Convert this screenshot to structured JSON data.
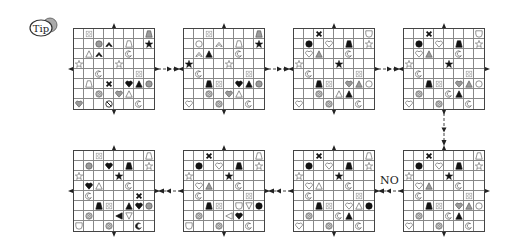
{
  "tip": {
    "label": "Tip"
  },
  "no_label": "NO",
  "colors": {
    "black": "#111111",
    "gray": "#9a9a9a",
    "outline": "#555555",
    "grid": "#888888"
  },
  "grids": [
    {
      "name": "grid-1",
      "x": 73,
      "y": 28,
      "cells": [
        [
          0,
          1,
          "ornate"
        ],
        [
          0,
          7,
          "trap-gray"
        ],
        [
          1,
          2,
          "circle-gray"
        ],
        [
          1,
          3,
          "chevron-black"
        ],
        [
          1,
          5,
          "trap-white"
        ],
        [
          1,
          7,
          "star-black"
        ],
        [
          2,
          1,
          "tri-white"
        ],
        [
          2,
          2,
          "chevron-black"
        ],
        [
          2,
          5,
          "crescent"
        ],
        [
          3,
          0,
          "star-white"
        ],
        [
          3,
          4,
          "star-white"
        ],
        [
          4,
          2,
          "crescent"
        ],
        [
          4,
          6,
          "ornate"
        ],
        [
          5,
          1,
          "trap-white"
        ],
        [
          5,
          3,
          "x-black"
        ],
        [
          5,
          5,
          "heart-black"
        ],
        [
          5,
          6,
          "tri-black"
        ],
        [
          5,
          7,
          "circle-gray"
        ],
        [
          6,
          2,
          "hatch"
        ],
        [
          6,
          4,
          "heart-gray"
        ],
        [
          6,
          5,
          "tri-white"
        ],
        [
          7,
          0,
          "heart-gray"
        ],
        [
          7,
          3,
          "nosign"
        ],
        [
          7,
          6,
          "crescent"
        ]
      ]
    },
    {
      "name": "grid-2",
      "x": 183,
      "y": 28,
      "cells": [
        [
          0,
          2,
          "ornate"
        ],
        [
          0,
          7,
          "trap-gray"
        ],
        [
          1,
          1,
          "circle-white"
        ],
        [
          1,
          3,
          "chevron-white"
        ],
        [
          1,
          5,
          "trap-white"
        ],
        [
          1,
          7,
          "star-black"
        ],
        [
          2,
          1,
          "chevron-white"
        ],
        [
          2,
          2,
          "tri-black"
        ],
        [
          2,
          5,
          "crescent"
        ],
        [
          3,
          0,
          "star-black"
        ],
        [
          3,
          4,
          "star-white"
        ],
        [
          4,
          1,
          "crescent"
        ],
        [
          4,
          6,
          "ornate"
        ],
        [
          5,
          2,
          "trap-black"
        ],
        [
          5,
          3,
          "ornate"
        ],
        [
          5,
          5,
          "heart-black"
        ],
        [
          5,
          6,
          "tri-black"
        ],
        [
          5,
          7,
          "circle-gray"
        ],
        [
          6,
          2,
          "hatch"
        ],
        [
          6,
          4,
          "heart-gray"
        ],
        [
          6,
          5,
          "tri-white"
        ],
        [
          7,
          0,
          "heart-white"
        ],
        [
          7,
          3,
          "hatch"
        ],
        [
          7,
          6,
          "crescent"
        ]
      ]
    },
    {
      "name": "grid-3",
      "x": 293,
      "y": 28,
      "cells": [
        [
          0,
          2,
          "x-black"
        ],
        [
          0,
          7,
          "shield-white"
        ],
        [
          1,
          1,
          "circle-black"
        ],
        [
          1,
          3,
          "heart-white"
        ],
        [
          1,
          5,
          "trap-black"
        ],
        [
          1,
          7,
          "star-white"
        ],
        [
          2,
          1,
          "heart-white"
        ],
        [
          2,
          2,
          "tri-gray"
        ],
        [
          2,
          5,
          "crescent"
        ],
        [
          3,
          0,
          "star-white"
        ],
        [
          3,
          4,
          "star-black"
        ],
        [
          4,
          1,
          "crescent"
        ],
        [
          4,
          6,
          "ornate"
        ],
        [
          5,
          2,
          "trap-black"
        ],
        [
          5,
          3,
          "ornate"
        ],
        [
          5,
          5,
          "heart-gray"
        ],
        [
          5,
          6,
          "tri-gray"
        ],
        [
          5,
          7,
          "circle-white"
        ],
        [
          6,
          2,
          "hatch"
        ],
        [
          6,
          4,
          "tri-white"
        ],
        [
          6,
          5,
          "tri-black"
        ],
        [
          7,
          0,
          "heart-white"
        ],
        [
          7,
          3,
          "hatch"
        ],
        [
          7,
          6,
          "crescent"
        ]
      ]
    },
    {
      "name": "grid-4",
      "x": 403,
      "y": 28,
      "cells": [
        [
          0,
          2,
          "x-black"
        ],
        [
          0,
          7,
          "shield-white"
        ],
        [
          1,
          1,
          "circle-black"
        ],
        [
          1,
          3,
          "heart-white"
        ],
        [
          1,
          5,
          "trap-black"
        ],
        [
          1,
          7,
          "star-white"
        ],
        [
          2,
          1,
          "heart-white"
        ],
        [
          2,
          2,
          "tri-gray"
        ],
        [
          2,
          5,
          "crescent"
        ],
        [
          3,
          0,
          "star-white"
        ],
        [
          3,
          4,
          "star-black"
        ],
        [
          4,
          1,
          "crescent"
        ],
        [
          4,
          6,
          "ornate"
        ],
        [
          5,
          2,
          "trap-black"
        ],
        [
          5,
          3,
          "ornate"
        ],
        [
          5,
          5,
          "heart-gray"
        ],
        [
          5,
          6,
          "tri-gray"
        ],
        [
          5,
          7,
          "circle-white"
        ],
        [
          6,
          1,
          "hatch"
        ],
        [
          6,
          4,
          "crescent"
        ],
        [
          6,
          5,
          "tri-black"
        ],
        [
          7,
          0,
          "heart-white"
        ],
        [
          7,
          3,
          "hatch"
        ],
        [
          7,
          6,
          "crescent"
        ]
      ]
    },
    {
      "name": "grid-5",
      "x": 73,
      "y": 150,
      "cells": [
        [
          0,
          2,
          "ornate"
        ],
        [
          0,
          7,
          "trap-white"
        ],
        [
          1,
          1,
          "circle-gray"
        ],
        [
          1,
          3,
          "heart-black"
        ],
        [
          1,
          5,
          "trap-black"
        ],
        [
          1,
          7,
          "star-white"
        ],
        [
          2,
          0,
          "star-white"
        ],
        [
          2,
          4,
          "star-black"
        ],
        [
          3,
          1,
          "heart-black"
        ],
        [
          3,
          2,
          "tri-white"
        ],
        [
          3,
          5,
          "crescent"
        ],
        [
          4,
          1,
          "crescent"
        ],
        [
          4,
          6,
          "x-black"
        ],
        [
          5,
          2,
          "trap-black"
        ],
        [
          5,
          3,
          "ornate"
        ],
        [
          5,
          5,
          "tri-black"
        ],
        [
          5,
          6,
          "heart-black"
        ],
        [
          5,
          7,
          "circle-gray"
        ],
        [
          6,
          1,
          "hatch"
        ],
        [
          6,
          4,
          "tri-left-black"
        ],
        [
          6,
          5,
          "tri-down-white"
        ],
        [
          7,
          0,
          "shield-white"
        ],
        [
          7,
          3,
          "hatch"
        ],
        [
          7,
          6,
          "crescent-black"
        ]
      ]
    },
    {
      "name": "grid-6",
      "x": 183,
      "y": 150,
      "cells": [
        [
          0,
          2,
          "x-black"
        ],
        [
          0,
          7,
          "trap-white"
        ],
        [
          1,
          1,
          "circle-black"
        ],
        [
          1,
          3,
          "heart-white"
        ],
        [
          1,
          5,
          "trap-black"
        ],
        [
          1,
          7,
          "star-white"
        ],
        [
          2,
          0,
          "star-white"
        ],
        [
          2,
          4,
          "star-black"
        ],
        [
          3,
          1,
          "heart-white"
        ],
        [
          3,
          2,
          "tri-gray"
        ],
        [
          3,
          5,
          "crescent"
        ],
        [
          4,
          1,
          "crescent"
        ],
        [
          4,
          6,
          "ornate"
        ],
        [
          5,
          2,
          "trap-black"
        ],
        [
          5,
          3,
          "ornate"
        ],
        [
          5,
          5,
          "shield-white"
        ],
        [
          5,
          6,
          "tri-down-white"
        ],
        [
          5,
          7,
          "circle-black"
        ],
        [
          6,
          1,
          "hatch"
        ],
        [
          6,
          4,
          "tri-left-white"
        ],
        [
          6,
          5,
          "heart-black"
        ],
        [
          7,
          0,
          "shield-white"
        ],
        [
          7,
          3,
          "hatch"
        ],
        [
          7,
          6,
          "crescent"
        ]
      ]
    },
    {
      "name": "grid-7",
      "x": 293,
      "y": 150,
      "cells": [
        [
          0,
          2,
          "x-black"
        ],
        [
          0,
          7,
          "trap-white"
        ],
        [
          1,
          1,
          "circle-black"
        ],
        [
          1,
          3,
          "heart-white"
        ],
        [
          1,
          5,
          "trap-black"
        ],
        [
          1,
          7,
          "star-white"
        ],
        [
          2,
          0,
          "star-white"
        ],
        [
          2,
          4,
          "star-black"
        ],
        [
          3,
          1,
          "heart-white"
        ],
        [
          3,
          2,
          "tri-white"
        ],
        [
          3,
          5,
          "crescent"
        ],
        [
          4,
          1,
          "crescent"
        ],
        [
          4,
          6,
          "ornate"
        ],
        [
          5,
          2,
          "trap-black"
        ],
        [
          5,
          3,
          "ornate"
        ],
        [
          5,
          5,
          "heart-white"
        ],
        [
          5,
          6,
          "tri-white"
        ],
        [
          5,
          7,
          "circle-black"
        ],
        [
          6,
          1,
          "hatch"
        ],
        [
          6,
          4,
          "crescent"
        ],
        [
          6,
          5,
          "tri-black"
        ],
        [
          7,
          0,
          "heart-white"
        ],
        [
          7,
          3,
          "hatch"
        ],
        [
          7,
          6,
          "crescent"
        ]
      ]
    },
    {
      "name": "grid-8",
      "x": 403,
      "y": 150,
      "cells": [
        [
          0,
          2,
          "x-black"
        ],
        [
          0,
          7,
          "trap-white"
        ],
        [
          1,
          1,
          "circle-black"
        ],
        [
          1,
          3,
          "heart-white"
        ],
        [
          1,
          5,
          "trap-black"
        ],
        [
          1,
          7,
          "star-white"
        ],
        [
          2,
          0,
          "star-white"
        ],
        [
          2,
          4,
          "star-black"
        ],
        [
          3,
          1,
          "heart-white"
        ],
        [
          3,
          2,
          "tri-gray"
        ],
        [
          3,
          5,
          "crescent"
        ],
        [
          4,
          1,
          "crescent"
        ],
        [
          4,
          6,
          "ornate"
        ],
        [
          5,
          2,
          "trap-black"
        ],
        [
          5,
          3,
          "ornate"
        ],
        [
          5,
          5,
          "heart-gray"
        ],
        [
          5,
          6,
          "tri-gray"
        ],
        [
          5,
          7,
          "circle-white"
        ],
        [
          6,
          1,
          "hatch"
        ],
        [
          6,
          4,
          "crescent"
        ],
        [
          6,
          5,
          "tri-black"
        ],
        [
          7,
          0,
          "heart-white"
        ],
        [
          7,
          3,
          "hatch"
        ],
        [
          7,
          6,
          "crescent"
        ]
      ]
    }
  ],
  "arrows": [
    {
      "name": "arrow-1-2",
      "dir": "right",
      "x1": 158,
      "x2": 180,
      "y": 69
    },
    {
      "name": "arrow-2-3",
      "dir": "right",
      "x1": 268,
      "x2": 290,
      "y": 69
    },
    {
      "name": "arrow-3-4",
      "dir": "right",
      "x1": 378,
      "x2": 400,
      "y": 69
    },
    {
      "name": "arrow-4-8",
      "dir": "down",
      "x": 444,
      "y1": 113,
      "y2": 146
    },
    {
      "name": "arrow-8-7",
      "dir": "left",
      "x1": 378,
      "x2": 400,
      "y": 191
    },
    {
      "name": "arrow-7-6",
      "dir": "left",
      "x1": 268,
      "x2": 290,
      "y": 191
    },
    {
      "name": "arrow-6-5",
      "dir": "left",
      "x1": 158,
      "x2": 180,
      "y": 191
    }
  ]
}
